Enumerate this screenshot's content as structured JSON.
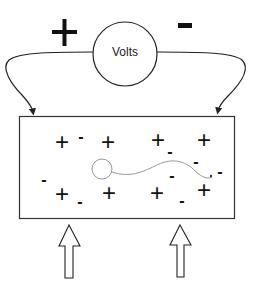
{
  "diagram": {
    "title": "",
    "meter": {
      "label": "Volts",
      "positive_terminal_symbol": "+",
      "negative_terminal_symbol": "-"
    },
    "charges": [
      {
        "symbol": "+",
        "x": 62,
        "y": 142
      },
      {
        "symbol": "-",
        "x": 81,
        "y": 137
      },
      {
        "symbol": "+",
        "x": 108,
        "y": 142
      },
      {
        "symbol": "+",
        "x": 158,
        "y": 140
      },
      {
        "symbol": "-",
        "x": 170,
        "y": 152
      },
      {
        "symbol": "+",
        "x": 204,
        "y": 140
      },
      {
        "symbol": "-",
        "x": 196,
        "y": 162
      },
      {
        "symbol": "-",
        "x": 44,
        "y": 180
      },
      {
        "symbol": "+",
        "x": 62,
        "y": 194
      },
      {
        "symbol": "-",
        "x": 80,
        "y": 202
      },
      {
        "symbol": "+",
        "x": 109,
        "y": 193
      },
      {
        "symbol": "-",
        "x": 172,
        "y": 176
      },
      {
        "symbol": "+",
        "x": 157,
        "y": 193
      },
      {
        "symbol": "-",
        "x": 182,
        "y": 201
      },
      {
        "symbol": "+",
        "x": 204,
        "y": 190
      },
      {
        "symbol": "-",
        "x": 220,
        "y": 172
      }
    ],
    "colors": {
      "stroke": "#222222",
      "wave": "#999999",
      "background": "#ffffff"
    }
  }
}
